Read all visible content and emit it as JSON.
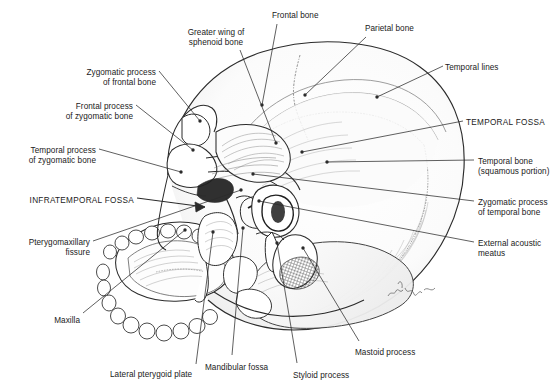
{
  "figure": {
    "signature": "artist-signature",
    "ink_color": "#1a1a1a",
    "background_color": "#ffffff",
    "line_color": "#2b2b2b"
  },
  "labels": [
    {
      "id": "greater-wing-sphenoid",
      "text": "Greater wing of\nsphenoid bone",
      "align": "center",
      "x": 216,
      "y": 28,
      "caps": false
    },
    {
      "id": "frontal-bone",
      "text": "Frontal bone",
      "align": "left",
      "x": 272,
      "y": 11,
      "caps": false
    },
    {
      "id": "parietal-bone",
      "text": "Parietal bone",
      "align": "left",
      "x": 365,
      "y": 24,
      "caps": false
    },
    {
      "id": "temporal-lines",
      "text": "Temporal lines",
      "align": "left",
      "x": 445,
      "y": 63,
      "caps": false
    },
    {
      "id": "temporal-fossa",
      "text": "TEMPORAL FOSSA",
      "align": "left",
      "x": 466,
      "y": 118,
      "caps": true
    },
    {
      "id": "temporal-bone-squamous",
      "text": "Temporal bone\n(squamous portion)",
      "align": "left",
      "x": 478,
      "y": 157,
      "caps": false
    },
    {
      "id": "zygomatic-process-temporal",
      "text": "Zygomatic process\nof temporal bone",
      "align": "left",
      "x": 478,
      "y": 198,
      "caps": false
    },
    {
      "id": "external-acoustic-meatus",
      "text": "External acoustic\nmeatus",
      "align": "left",
      "x": 478,
      "y": 239,
      "caps": false
    },
    {
      "id": "zygomatic-process-frontal",
      "text": "Zygomatic process\nof frontal bone",
      "align": "right",
      "x": 156,
      "y": 68,
      "caps": false
    },
    {
      "id": "frontal-process-zygomatic",
      "text": "Frontal process\nof zygomatic bone",
      "align": "right",
      "x": 133,
      "y": 102,
      "caps": false
    },
    {
      "id": "temporal-process-zygomatic",
      "text": "Temporal process\nof zygomatic bone",
      "align": "right",
      "x": 96,
      "y": 146,
      "caps": false
    },
    {
      "id": "infratemporal-fossa",
      "text": "INFRATEMPORAL FOSSA",
      "align": "right",
      "x": 134,
      "y": 196,
      "caps": true
    },
    {
      "id": "pterygomaxillary-fissure",
      "text": "Pterygomaxillary\nfissure",
      "align": "right",
      "x": 90,
      "y": 238,
      "caps": false
    },
    {
      "id": "maxilla",
      "text": "Maxilla",
      "align": "right",
      "x": 80,
      "y": 316,
      "caps": false
    },
    {
      "id": "lateral-pterygoid-plate",
      "text": "Lateral pterygoid plate",
      "align": "left",
      "x": 110,
      "y": 370,
      "caps": false
    },
    {
      "id": "mandibular-fossa",
      "text": "Mandibular fossa",
      "align": "left",
      "x": 205,
      "y": 363,
      "caps": false
    },
    {
      "id": "styloid-process",
      "text": "Styloid process",
      "align": "left",
      "x": 293,
      "y": 371,
      "caps": false
    },
    {
      "id": "mastoid-process",
      "text": "Mastoid process",
      "align": "left",
      "x": 355,
      "y": 348,
      "caps": false
    }
  ],
  "leaders": [
    {
      "id": "leader-greater-wing-sphenoid",
      "path": "M 240 50 L 276 143",
      "dot": [
        276,
        143
      ]
    },
    {
      "id": "leader-frontal-bone",
      "path": "M 277 24 L 262 105",
      "dot": [
        262,
        105
      ]
    },
    {
      "id": "leader-parietal-bone",
      "path": "M 366 37 L 305 95",
      "dot": [
        305,
        95
      ]
    },
    {
      "id": "leader-temporal-lines",
      "path": "M 443 66 L 377 97",
      "dot": [
        377,
        97
      ]
    },
    {
      "id": "leader-temporal-fossa",
      "path": "M 463 121 L 302 152",
      "dot": [
        302,
        152
      ]
    },
    {
      "id": "leader-temporal-bone-squamous",
      "path": "M 474 160 L 327 162",
      "dot": [
        327,
        162
      ]
    },
    {
      "id": "leader-zygomatic-process-temporal",
      "path": "M 474 201 L 253 174",
      "dot": [
        253,
        174
      ]
    },
    {
      "id": "leader-external-acoustic-meatus",
      "path": "M 474 242 L 259 201",
      "dot": [
        259,
        201
      ]
    },
    {
      "id": "leader-zygomatic-process-frontal",
      "path": "M 159 71 L 200 121",
      "dot": [
        200,
        121
      ]
    },
    {
      "id": "leader-frontal-process-zygomatic",
      "path": "M 136 105 L 193 150",
      "dot": [
        193,
        150
      ]
    },
    {
      "id": "leader-temporal-process-zygomatic",
      "path": "M 99 149 L 181 172",
      "dot": [
        181,
        172
      ]
    },
    {
      "id": "leader-infratemporal-fossa",
      "path": "M 137 198 L 207 207",
      "arrow": true
    },
    {
      "id": "leader-pterygomaxillary-fissure",
      "path": "M 93 241 L 241 190",
      "dot": [
        241,
        190
      ]
    },
    {
      "id": "leader-maxilla",
      "path": "M 83 313 L 185 230",
      "dot": [
        185,
        230
      ]
    },
    {
      "id": "leader-lateral-pterygoid-plate",
      "path": "M 196 364 L 213 232",
      "dot": [
        213,
        232
      ]
    },
    {
      "id": "leader-mandibular-fossa",
      "path": "M 232 355 L 243 228",
      "dot": [
        243,
        228
      ]
    },
    {
      "id": "leader-styloid-process",
      "path": "M 297 363 L 277 243",
      "dot": [
        277,
        243
      ]
    },
    {
      "id": "leader-mastoid-process",
      "path": "M 359 341 L 303 248",
      "dot": [
        303,
        248
      ]
    }
  ]
}
